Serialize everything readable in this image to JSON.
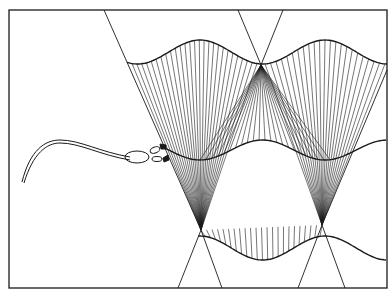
{
  "diagram": {
    "type": "wave-ray caustic drawing",
    "stroke_color": "#1a1a1a",
    "background": "#ffffff",
    "frame": {
      "x": 9,
      "y": 10,
      "w": 378,
      "h": 278
    },
    "labels": []
  }
}
